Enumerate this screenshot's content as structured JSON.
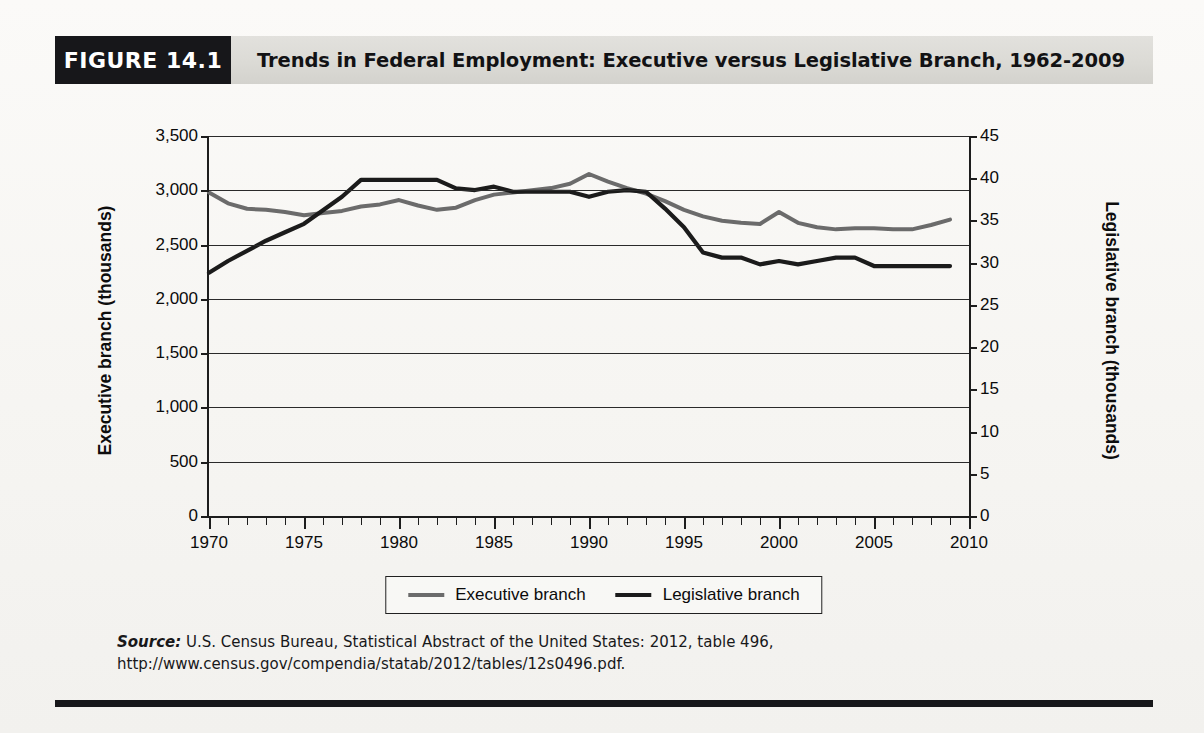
{
  "figure": {
    "badge": "FIGURE 14.1",
    "title": "Trends in Federal Employment: Executive versus Legislative Branch, 1962-2009",
    "source_prefix": "Source:",
    "source_text": " U.S. Census Bureau, Statistical Abstract of the United States: 2012, table 496, http://www.census.gov/compendia/statab/2012/tables/12s0496.pdf."
  },
  "colors": {
    "executive": "#6b6b6b",
    "legislative": "#1b1b1b",
    "badge_background": "#17171a",
    "header_background": "#dcdbd6",
    "axis": "#1d1d1d",
    "page_background": "#f6f5f2"
  },
  "chart_data": {
    "type": "line",
    "title": "Trends in Federal Employment: Executive versus Legislative Branch, 1962-2009",
    "xlabel": "",
    "ylabel": "Executive branch (thousands)",
    "ylabel_right": "Legislative branch (thousands)",
    "xlim": [
      1970,
      2010
    ],
    "ylim": [
      0,
      3500
    ],
    "ylim_right": [
      0,
      45
    ],
    "grid": true,
    "legend_position": "bottom-center",
    "xticks": [
      1970,
      1975,
      1980,
      1985,
      1990,
      1995,
      2000,
      2005,
      2010
    ],
    "xtick_labels": [
      "1970",
      "1975",
      "1980",
      "1985",
      "1990",
      "1995",
      "2000",
      "2005",
      "2010"
    ],
    "xtick_minor_step": 1,
    "yticks_left": [
      0,
      500,
      1000,
      1500,
      2000,
      2500,
      3000,
      3500
    ],
    "ytick_labels_left": [
      "0",
      "500",
      "1,000",
      "1,500",
      "2,000",
      "2,500",
      "3,000",
      "3,500"
    ],
    "yticks_right": [
      0,
      5,
      10,
      15,
      20,
      25,
      30,
      35,
      40,
      45
    ],
    "ytick_labels_right": [
      "0",
      "5",
      "10",
      "15",
      "20",
      "25",
      "30",
      "35",
      "40",
      "45"
    ],
    "series": [
      {
        "name": "Executive branch",
        "axis": "left",
        "units": "thousands",
        "color": "#6b6b6b",
        "x": [
          1970,
          1971,
          1972,
          1973,
          1974,
          1975,
          1976,
          1977,
          1978,
          1979,
          1980,
          1981,
          1982,
          1983,
          1984,
          1985,
          1986,
          1987,
          1988,
          1989,
          1990,
          1991,
          1992,
          1993,
          1994,
          1995,
          1996,
          1997,
          1998,
          1999,
          2000,
          2001,
          2002,
          2003,
          2004,
          2005,
          2006,
          2007,
          2008,
          2009
        ],
        "y": [
          2980,
          2880,
          2830,
          2820,
          2800,
          2770,
          2790,
          2810,
          2850,
          2870,
          2910,
          2860,
          2820,
          2840,
          2910,
          2960,
          2980,
          3000,
          3020,
          3060,
          3150,
          3080,
          3020,
          2970,
          2900,
          2820,
          2760,
          2720,
          2700,
          2690,
          2800,
          2700,
          2660,
          2640,
          2650,
          2650,
          2640,
          2640,
          2680,
          2730
        ]
      },
      {
        "name": "Legislative branch",
        "axis": "right",
        "units": "thousands",
        "color": "#1b1b1b",
        "x": [
          1970,
          1971,
          1972,
          1973,
          1974,
          1975,
          1976,
          1977,
          1978,
          1979,
          1980,
          1981,
          1982,
          1983,
          1984,
          1985,
          1986,
          1987,
          1988,
          1989,
          1990,
          1991,
          1992,
          1993,
          1994,
          1995,
          1996,
          1997,
          1998,
          1999,
          2000,
          2001,
          2002,
          2003,
          2004,
          2005,
          2006,
          2007,
          2008,
          2009
        ],
        "y": [
          28.8,
          30.2,
          31.4,
          32.6,
          33.6,
          34.6,
          36.2,
          37.8,
          39.8,
          39.8,
          39.8,
          39.8,
          39.8,
          38.8,
          38.6,
          39.0,
          38.4,
          38.4,
          38.4,
          38.4,
          37.8,
          38.4,
          38.6,
          38.4,
          36.4,
          34.2,
          31.2,
          30.6,
          30.6,
          29.8,
          30.2,
          29.8,
          30.2,
          30.6,
          30.6,
          29.6,
          29.6,
          29.6,
          29.6,
          29.6
        ]
      }
    ],
    "legend": [
      {
        "label": "Executive branch",
        "color": "#6b6b6b"
      },
      {
        "label": "Legislative branch",
        "color": "#1b1b1b"
      }
    ]
  },
  "ghost_text": "studies in pending legislative proposals and other policy options, testifies on investigations and committee reports, and responds to inquiries. GAO prepares legal opinions, adjudicates bid protest decisions, and advises Congress and the executive branch on government and administration. Because of the GAO's expanding staff, role, and scope, Congress has become more vigorous in its oversight capacity. Once considered a minor instrument, today the Congressional Research Service gives intense oversight. Accounting Office investigations add to any nation in the world to be a better steward of the federal budget."
}
